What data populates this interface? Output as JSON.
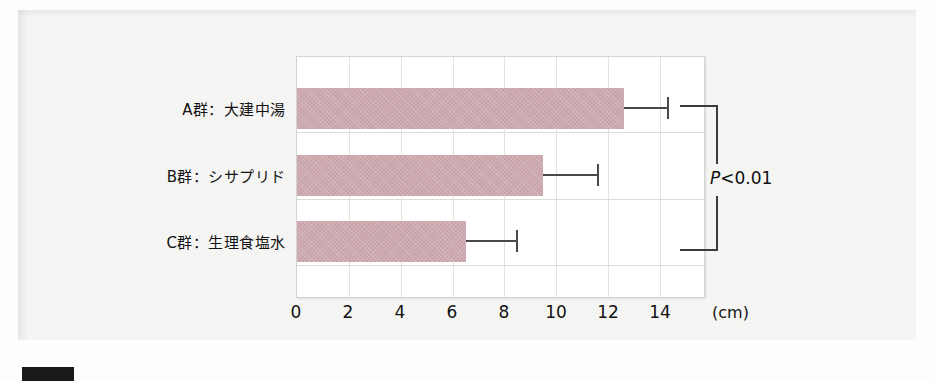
{
  "chart_data": {
    "type": "bar",
    "orientation": "horizontal",
    "title": "",
    "xlabel": "",
    "ylabel": "",
    "unit": "(cm)",
    "xlim": [
      0,
      15.7
    ],
    "xticks": [
      0,
      2,
      4,
      6,
      8,
      10,
      12,
      14
    ],
    "xtick_labels": [
      "0",
      "2",
      "4",
      "6",
      "8",
      "10",
      "12",
      "14"
    ],
    "grid": true,
    "legend": "none",
    "categories": [
      "A群：大建中湯",
      "B群：シサプリド",
      "C群：生理食塩水"
    ],
    "values": [
      12.6,
      9.5,
      6.5
    ],
    "errors_upper": [
      1.7,
      2.1,
      2.0
    ],
    "series": [
      {
        "name": "移動距離",
        "values": [
          12.6,
          9.5,
          6.5
        ],
        "errors_upper": [
          1.7,
          2.1,
          2.0
        ]
      }
    ],
    "bar_color": "#c8a3a9",
    "error_color": "#4a4a4a",
    "annotations": [
      {
        "text": "P<0.01",
        "text_p": "P",
        "text_rest": "<0.01",
        "type": "significance-bracket",
        "from_category": "A群：大建中湯",
        "to_category": "C群：生理食塩水"
      }
    ]
  },
  "axis": {
    "ticks": [
      "0",
      "2",
      "4",
      "6",
      "8",
      "10",
      "12",
      "14"
    ],
    "unit_label": "(cm)"
  },
  "categories": {
    "items": [
      {
        "label": "A群：大建中湯"
      },
      {
        "label": "B群：シサプリド"
      },
      {
        "label": "C群：生理食塩水"
      }
    ]
  },
  "significance": {
    "p_symbol": "P",
    "comparison": "<0.01",
    "full_text": "P<0.01"
  }
}
